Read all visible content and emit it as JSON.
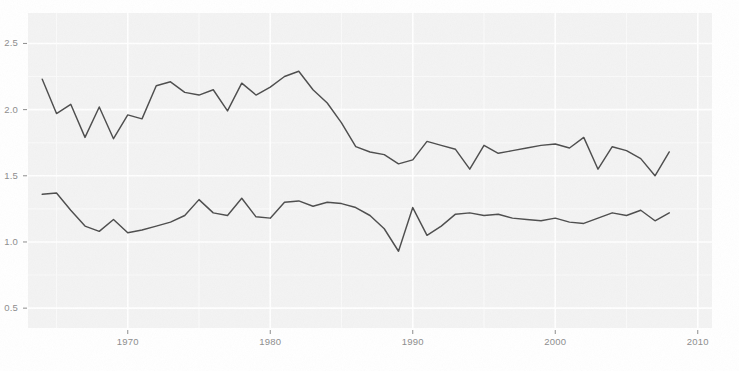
{
  "chart_data": {
    "type": "line",
    "title": "",
    "subtitle": "",
    "xlabel": "",
    "ylabel": "",
    "xlim": [
      1963,
      2011
    ],
    "ylim": [
      0.35,
      2.73
    ],
    "grid": true,
    "legend": null,
    "y_ticks": [
      0.5,
      1.0,
      1.5,
      2.0,
      2.5
    ],
    "y_tick_labels": [
      "0.5",
      "1.0",
      "1.5",
      "2.0",
      "2.5"
    ],
    "x_ticks": [
      1970,
      1980,
      1990,
      2000,
      2010
    ],
    "x_tick_labels": [
      "1970",
      "1980",
      "1990",
      "2000",
      "2010"
    ],
    "x": [
      1964,
      1965,
      1966,
      1967,
      1968,
      1969,
      1970,
      1971,
      1972,
      1973,
      1974,
      1975,
      1976,
      1977,
      1978,
      1979,
      1980,
      1981,
      1982,
      1983,
      1984,
      1985,
      1986,
      1987,
      1988,
      1989,
      1990,
      1991,
      1992,
      1993,
      1994,
      1995,
      1996,
      1997,
      1998,
      1999,
      2000,
      2001,
      2002,
      2003,
      2004,
      2005,
      2006,
      2007,
      2008
    ],
    "series": [
      {
        "name": "upper-series",
        "color": "#4d4d4d",
        "values": [
          2.23,
          1.97,
          2.04,
          1.79,
          2.02,
          1.78,
          1.96,
          1.93,
          2.18,
          2.21,
          2.13,
          2.11,
          2.15,
          1.99,
          2.2,
          2.11,
          2.17,
          2.25,
          2.29,
          2.15,
          2.05,
          1.9,
          1.72,
          1.68,
          1.66,
          1.59,
          1.62,
          1.76,
          1.73,
          1.7,
          1.55,
          1.73,
          1.67,
          1.69,
          1.71,
          1.73,
          1.74,
          1.71,
          1.79,
          1.55,
          1.72,
          1.69,
          1.63,
          1.5,
          1.68
        ]
      },
      {
        "name": "lower-series",
        "color": "#4d4d4d",
        "values": [
          1.36,
          1.37,
          1.24,
          1.12,
          1.08,
          1.17,
          1.07,
          1.09,
          1.12,
          1.15,
          1.2,
          1.32,
          1.22,
          1.2,
          1.33,
          1.19,
          1.18,
          1.3,
          1.31,
          1.27,
          1.3,
          1.29,
          1.26,
          1.2,
          1.1,
          0.93,
          1.26,
          1.05,
          1.12,
          1.21,
          1.22,
          1.2,
          1.21,
          1.18,
          1.17,
          1.16,
          1.18,
          1.15,
          1.14,
          1.18,
          1.22,
          1.2,
          1.24,
          1.16,
          1.22
        ]
      }
    ],
    "colors": {
      "panel_background": "#f3f3f3",
      "figure_background": "#ffffff",
      "grid_major": "#ffffff",
      "grid_minor": "#fafafa",
      "line": "#4d4d4d",
      "tick_text": "#8d8d8d"
    }
  }
}
